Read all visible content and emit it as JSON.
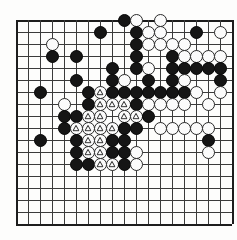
{
  "figure": {
    "name": "go-board-diagram",
    "board_size": 19,
    "visible_columns": 18,
    "visible_rows": 17,
    "colors": {
      "background": "#fdfdfc",
      "grid": "#3b3b3b",
      "border": "#1d1d1d",
      "black_stone": "#151515",
      "white_stone": "#fbfbfb",
      "stone_outline": "#2a2a2a",
      "hoshi": "#222222"
    },
    "geometry": {
      "origin_x": 16,
      "origin_y": 20,
      "pitch": 12,
      "stone_diameter": 13
    }
  },
  "legend": {
    "marker_symbol": "triangle",
    "marker_meaning": "marked white stones"
  },
  "hoshi_points": [
    {
      "col": 4,
      "row": 9
    }
  ],
  "stones": [
    {
      "col": 9,
      "row": 0,
      "color": "black",
      "mark": ""
    },
    {
      "col": 10,
      "row": 0,
      "color": "white",
      "mark": ""
    },
    {
      "col": 12,
      "row": 0,
      "color": "white",
      "mark": ""
    },
    {
      "col": 7,
      "row": 1,
      "color": "black",
      "mark": ""
    },
    {
      "col": 10,
      "row": 1,
      "color": "black",
      "mark": ""
    },
    {
      "col": 11,
      "row": 1,
      "color": "white",
      "mark": ""
    },
    {
      "col": 12,
      "row": 1,
      "color": "white",
      "mark": ""
    },
    {
      "col": 15,
      "row": 1,
      "color": "black",
      "mark": ""
    },
    {
      "col": 17,
      "row": 1,
      "color": "white",
      "mark": ""
    },
    {
      "col": 3,
      "row": 2,
      "color": "white",
      "mark": ""
    },
    {
      "col": 10,
      "row": 2,
      "color": "black",
      "mark": ""
    },
    {
      "col": 11,
      "row": 2,
      "color": "white",
      "mark": ""
    },
    {
      "col": 12,
      "row": 2,
      "color": "white",
      "mark": ""
    },
    {
      "col": 13,
      "row": 2,
      "color": "white",
      "mark": ""
    },
    {
      "col": 14,
      "row": 2,
      "color": "white",
      "mark": ""
    },
    {
      "col": 3,
      "row": 3,
      "color": "black",
      "mark": ""
    },
    {
      "col": 5,
      "row": 3,
      "color": "black",
      "mark": ""
    },
    {
      "col": 10,
      "row": 3,
      "color": "black",
      "mark": ""
    },
    {
      "col": 13,
      "row": 3,
      "color": "black",
      "mark": ""
    },
    {
      "col": 14,
      "row": 3,
      "color": "white",
      "mark": ""
    },
    {
      "col": 15,
      "row": 3,
      "color": "white",
      "mark": ""
    },
    {
      "col": 16,
      "row": 3,
      "color": "white",
      "mark": ""
    },
    {
      "col": 17,
      "row": 3,
      "color": "white",
      "mark": ""
    },
    {
      "col": 8,
      "row": 4,
      "color": "black",
      "mark": ""
    },
    {
      "col": 10,
      "row": 4,
      "color": "black",
      "mark": ""
    },
    {
      "col": 11,
      "row": 4,
      "color": "white",
      "mark": ""
    },
    {
      "col": 13,
      "row": 4,
      "color": "black",
      "mark": ""
    },
    {
      "col": 14,
      "row": 4,
      "color": "black",
      "mark": ""
    },
    {
      "col": 15,
      "row": 4,
      "color": "black",
      "mark": ""
    },
    {
      "col": 16,
      "row": 4,
      "color": "black",
      "mark": ""
    },
    {
      "col": 17,
      "row": 4,
      "color": "black",
      "mark": ""
    },
    {
      "col": 5,
      "row": 5,
      "color": "black",
      "mark": ""
    },
    {
      "col": 8,
      "row": 5,
      "color": "black",
      "mark": ""
    },
    {
      "col": 9,
      "row": 5,
      "color": "white",
      "mark": ""
    },
    {
      "col": 11,
      "row": 5,
      "color": "black",
      "mark": ""
    },
    {
      "col": 13,
      "row": 5,
      "color": "black",
      "mark": ""
    },
    {
      "col": 14,
      "row": 5,
      "color": "white",
      "mark": ""
    },
    {
      "col": 17,
      "row": 5,
      "color": "black",
      "mark": ""
    },
    {
      "col": 2,
      "row": 6,
      "color": "black",
      "mark": ""
    },
    {
      "col": 6,
      "row": 6,
      "color": "black",
      "mark": ""
    },
    {
      "col": 7,
      "row": 6,
      "color": "white",
      "mark": "triangle"
    },
    {
      "col": 8,
      "row": 6,
      "color": "black",
      "mark": ""
    },
    {
      "col": 9,
      "row": 6,
      "color": "black",
      "mark": ""
    },
    {
      "col": 10,
      "row": 6,
      "color": "black",
      "mark": ""
    },
    {
      "col": 11,
      "row": 6,
      "color": "black",
      "mark": ""
    },
    {
      "col": 12,
      "row": 6,
      "color": "black",
      "mark": ""
    },
    {
      "col": 13,
      "row": 6,
      "color": "black",
      "mark": ""
    },
    {
      "col": 14,
      "row": 6,
      "color": "black",
      "mark": ""
    },
    {
      "col": 15,
      "row": 6,
      "color": "white",
      "mark": ""
    },
    {
      "col": 17,
      "row": 6,
      "color": "white",
      "mark": ""
    },
    {
      "col": 4,
      "row": 7,
      "color": "white",
      "mark": ""
    },
    {
      "col": 6,
      "row": 7,
      "color": "black",
      "mark": ""
    },
    {
      "col": 7,
      "row": 7,
      "color": "white",
      "mark": "triangle"
    },
    {
      "col": 8,
      "row": 7,
      "color": "white",
      "mark": "triangle"
    },
    {
      "col": 9,
      "row": 7,
      "color": "white",
      "mark": "triangle"
    },
    {
      "col": 10,
      "row": 7,
      "color": "black",
      "mark": ""
    },
    {
      "col": 11,
      "row": 7,
      "color": "white",
      "mark": ""
    },
    {
      "col": 12,
      "row": 7,
      "color": "white",
      "mark": ""
    },
    {
      "col": 13,
      "row": 7,
      "color": "white",
      "mark": ""
    },
    {
      "col": 14,
      "row": 7,
      "color": "white",
      "mark": ""
    },
    {
      "col": 16,
      "row": 7,
      "color": "white",
      "mark": ""
    },
    {
      "col": 4,
      "row": 8,
      "color": "black",
      "mark": ""
    },
    {
      "col": 5,
      "row": 8,
      "color": "black",
      "mark": ""
    },
    {
      "col": 6,
      "row": 8,
      "color": "white",
      "mark": "triangle"
    },
    {
      "col": 7,
      "row": 8,
      "color": "white",
      "mark": "triangle"
    },
    {
      "col": 9,
      "row": 8,
      "color": "white",
      "mark": "triangle"
    },
    {
      "col": 10,
      "row": 8,
      "color": "white",
      "mark": "triangle"
    },
    {
      "col": 11,
      "row": 8,
      "color": "black",
      "mark": ""
    },
    {
      "col": 4,
      "row": 9,
      "color": "black",
      "mark": ""
    },
    {
      "col": 5,
      "row": 9,
      "color": "white",
      "mark": "triangle"
    },
    {
      "col": 6,
      "row": 9,
      "color": "white",
      "mark": "triangle"
    },
    {
      "col": 7,
      "row": 9,
      "color": "white",
      "mark": "triangle"
    },
    {
      "col": 8,
      "row": 9,
      "color": "white",
      "mark": "triangle"
    },
    {
      "col": 9,
      "row": 9,
      "color": "black",
      "mark": ""
    },
    {
      "col": 10,
      "row": 9,
      "color": "black",
      "mark": ""
    },
    {
      "col": 12,
      "row": 9,
      "color": "white",
      "mark": ""
    },
    {
      "col": 13,
      "row": 9,
      "color": "white",
      "mark": ""
    },
    {
      "col": 14,
      "row": 9,
      "color": "white",
      "mark": ""
    },
    {
      "col": 15,
      "row": 9,
      "color": "white",
      "mark": ""
    },
    {
      "col": 16,
      "row": 9,
      "color": "white",
      "mark": ""
    },
    {
      "col": 2,
      "row": 10,
      "color": "black",
      "mark": ""
    },
    {
      "col": 5,
      "row": 10,
      "color": "black",
      "mark": ""
    },
    {
      "col": 6,
      "row": 10,
      "color": "white",
      "mark": "triangle"
    },
    {
      "col": 7,
      "row": 10,
      "color": "white",
      "mark": "triangle"
    },
    {
      "col": 8,
      "row": 10,
      "color": "black",
      "mark": ""
    },
    {
      "col": 9,
      "row": 10,
      "color": "black",
      "mark": ""
    },
    {
      "col": 16,
      "row": 10,
      "color": "black",
      "mark": ""
    },
    {
      "col": 5,
      "row": 11,
      "color": "black",
      "mark": ""
    },
    {
      "col": 6,
      "row": 11,
      "color": "white",
      "mark": "triangle"
    },
    {
      "col": 7,
      "row": 11,
      "color": "white",
      "mark": "triangle"
    },
    {
      "col": 8,
      "row": 11,
      "color": "black",
      "mark": ""
    },
    {
      "col": 9,
      "row": 11,
      "color": "black",
      "mark": ""
    },
    {
      "col": 10,
      "row": 11,
      "color": "white",
      "mark": ""
    },
    {
      "col": 16,
      "row": 11,
      "color": "white",
      "mark": ""
    },
    {
      "col": 5,
      "row": 12,
      "color": "black",
      "mark": ""
    },
    {
      "col": 6,
      "row": 12,
      "color": "black",
      "mark": ""
    },
    {
      "col": 7,
      "row": 12,
      "color": "white",
      "mark": "triangle"
    },
    {
      "col": 8,
      "row": 12,
      "color": "white",
      "mark": "triangle"
    },
    {
      "col": 9,
      "row": 12,
      "color": "black",
      "mark": ""
    },
    {
      "col": 10,
      "row": 12,
      "color": "white",
      "mark": ""
    }
  ]
}
